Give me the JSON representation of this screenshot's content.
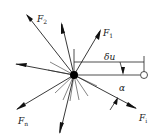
{
  "diagram": {
    "title": "",
    "center_point": {
      "x": 74,
      "y": 75,
      "label": "particle"
    },
    "forces": [
      {
        "id": "F1",
        "label": "F",
        "sub": "1"
      },
      {
        "id": "F2",
        "label": "F",
        "sub": "2"
      },
      {
        "id": "Fi",
        "label": "F",
        "sub": "i"
      },
      {
        "id": "Fn",
        "label": "F",
        "sub": "n"
      }
    ],
    "annotations": {
      "displacement": "δu",
      "angle": "α"
    },
    "colors": {
      "stroke": "#222222",
      "background": "#ffffff"
    }
  }
}
